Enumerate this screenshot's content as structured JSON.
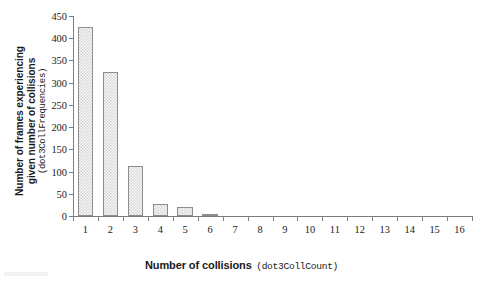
{
  "chart_data": {
    "type": "bar",
    "title": "",
    "xlabel_bold": "Number of collisions",
    "xlabel_mono": "(dot3CollCount)",
    "ylabel_bold_line1": "Number of frames experiencing",
    "ylabel_bold_line2": "given number of collisions",
    "ylabel_mono": "(dot3CollFrequencies)",
    "categories": [
      "1",
      "2",
      "3",
      "4",
      "5",
      "6",
      "7",
      "8",
      "9",
      "10",
      "11",
      "12",
      "13",
      "14",
      "15",
      "16"
    ],
    "values": [
      425,
      324,
      112,
      26,
      20,
      3,
      0,
      0,
      0,
      0,
      0,
      0,
      0,
      0,
      0,
      0
    ],
    "ylim": [
      0,
      450
    ],
    "ytick_values": [
      0,
      50,
      100,
      150,
      200,
      250,
      300,
      350,
      400,
      450
    ],
    "ytick_labels": [
      "0",
      "50",
      "100",
      "150",
      "200",
      "250",
      "300",
      "350",
      "400",
      "450"
    ],
    "xtick_labels": [
      "1",
      "2",
      "3",
      "4",
      "5",
      "6",
      "7",
      "8",
      "9",
      "10",
      "11",
      "12",
      "13",
      "14",
      "15",
      "16"
    ],
    "grid": false,
    "legend": false,
    "legend_position": "none",
    "bar_fill_color": "#d9d9d9",
    "bar_border_color": "#8d8d8d",
    "axis_color": "#7d7d7d",
    "background_color": "#ffffff"
  }
}
